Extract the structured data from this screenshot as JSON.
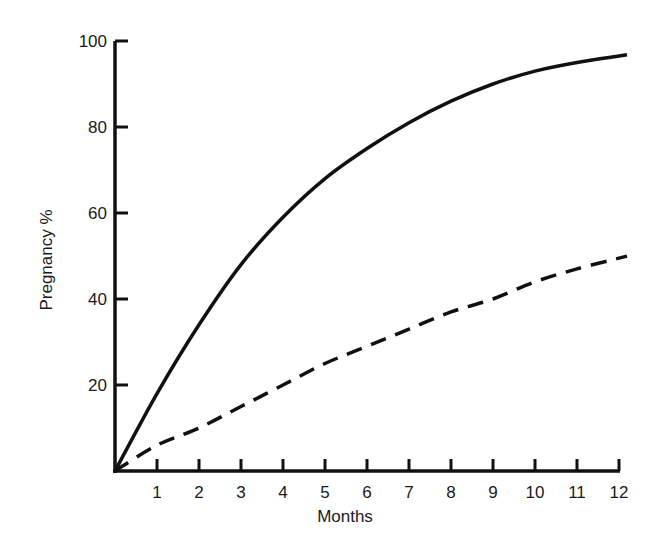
{
  "chart_data": {
    "type": "line",
    "title": "",
    "xlabel": "Months",
    "ylabel": "Pregnancy %",
    "x": [
      0,
      1,
      2,
      3,
      4,
      5,
      6,
      7,
      8,
      9,
      10,
      11,
      12
    ],
    "x_ticks": [
      "1",
      "2",
      "3",
      "4",
      "5",
      "6",
      "7",
      "8",
      "9",
      "10",
      "11",
      "12"
    ],
    "y_ticks": [
      "20",
      "40",
      "60",
      "80",
      "100"
    ],
    "xlim": [
      0,
      12
    ],
    "ylim": [
      0,
      100
    ],
    "grid": false,
    "legend": null,
    "series": [
      {
        "name": "solid",
        "style": "solid",
        "color": "#111111",
        "values": [
          0,
          18,
          34,
          48,
          59,
          68,
          75,
          81,
          86,
          90,
          93,
          95,
          96.5
        ]
      },
      {
        "name": "dashed",
        "style": "dashed",
        "color": "#111111",
        "values": [
          0,
          6,
          10,
          15,
          20,
          25,
          29,
          33,
          37,
          40,
          44,
          47,
          49.5
        ]
      }
    ]
  },
  "axes": {
    "x_title": "Months",
    "y_title": "Pregnancy %"
  }
}
